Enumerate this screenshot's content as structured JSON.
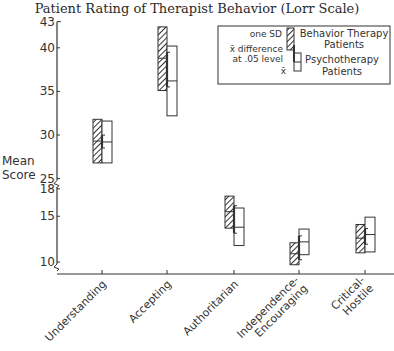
{
  "title": "Patient Rating of Therapist Behavior (Lorr Scale)",
  "y_axis_label_line1": "Mean",
  "y_axis_label_line2": "Score",
  "y_ticks": [
    "43",
    "40",
    "35",
    "30",
    "25",
    "18",
    "15",
    "10"
  ],
  "categories": [
    "Understanding",
    "Accepting",
    "Authoritarian",
    "Independence-Encouraging",
    "Critical-Hostile"
  ],
  "category_labels": [
    [
      "Understanding"
    ],
    [
      "Accepting"
    ],
    [
      "Authoritarian"
    ],
    [
      "Independence-",
      "Encouraging"
    ],
    [
      "Critical-",
      "Hostile"
    ]
  ],
  "legend": {
    "one_sd": "one SD",
    "x_diff_line1": "x̄ difference",
    "x_diff_line2": "at .05 level",
    "x_bar": "x̄",
    "behavior_line1": "Behavior Therapy",
    "behavior_line2": "Patients",
    "psycho_line1": "Psychotherapy",
    "psycho_line2": "Patients"
  },
  "colors": {
    "ink": "#333333",
    "background": "#ffffff"
  },
  "chart_data": {
    "type": "box (mean ± 1 SD)",
    "title": "Patient Rating of Therapist Behavior (Lorr Scale)",
    "xlabel": "",
    "ylabel": "Mean Score",
    "y_axis_broken": true,
    "y_segments": [
      {
        "range": [
          25,
          43
        ]
      },
      {
        "range": [
          10,
          18
        ]
      }
    ],
    "categories": [
      "Understanding",
      "Accepting",
      "Authoritarian",
      "Independence-Encouraging",
      "Critical-Hostile"
    ],
    "series": [
      {
        "name": "Behavior Therapy Patients",
        "style": "hatched",
        "mean": [
          29.3,
          38.8,
          15.5,
          10.9,
          12.6
        ],
        "sd_low": [
          26.8,
          35.1,
          13.7,
          9.7,
          11.0
        ],
        "sd_high": [
          31.8,
          42.4,
          17.2,
          12.1,
          14.1
        ]
      },
      {
        "name": "Psychotherapy Patients",
        "style": "open",
        "mean": [
          29.2,
          36.2,
          13.8,
          12.2,
          13.0
        ],
        "sd_low": [
          26.8,
          32.2,
          11.8,
          10.8,
          11.1
        ],
        "sd_high": [
          31.6,
          40.2,
          15.9,
          13.6,
          14.9
        ]
      }
    ],
    "legend_position": "upper right, boxed",
    "grid": false
  }
}
